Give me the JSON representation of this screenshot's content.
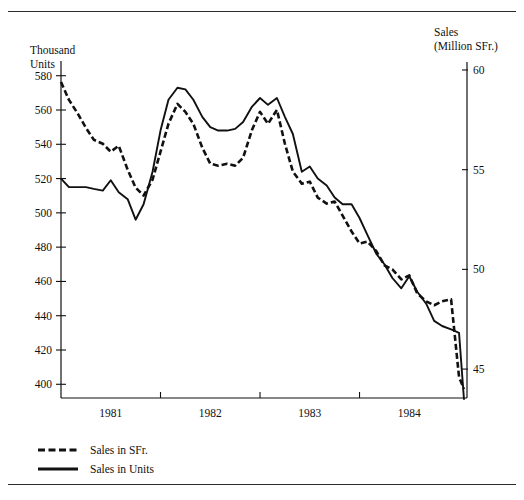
{
  "page": {
    "clipped_header_text": "",
    "background": "#ffffff",
    "ink": "#111111"
  },
  "chart_data": {
    "type": "line",
    "title": "",
    "subtitle": "",
    "xlabel": "",
    "ylabel": "Thousand\nUnits",
    "y2label": "Sales\n(Million SFr.)",
    "grid": false,
    "legend_position": "below-left",
    "x_axis": {
      "tick_labels": [
        "1981",
        "1982",
        "1983",
        "1984"
      ],
      "tick_positions": [
        0.5,
        1.5,
        2.5,
        3.5
      ],
      "boundary_ticks": [
        1,
        2,
        3
      ],
      "xlim": [
        0,
        4.08
      ]
    },
    "y_axis_left": {
      "label": "Thousand Units",
      "tick_labels": [
        "400",
        "420",
        "440",
        "460",
        "480",
        "500",
        "520",
        "540",
        "560",
        "580"
      ],
      "tick_values": [
        400,
        420,
        440,
        460,
        480,
        500,
        520,
        540,
        560,
        580
      ],
      "ylim": [
        392,
        588
      ]
    },
    "y_axis_right": {
      "label": "Sales (Million SFr.)",
      "tick_labels": [
        "45",
        "50",
        "55",
        "60"
      ],
      "tick_values": [
        45,
        50,
        55,
        60
      ],
      "ylim": [
        43.55,
        60.4
      ]
    },
    "series": [
      {
        "name": "Sales in SFr.",
        "axis": "right",
        "style": "dashed",
        "color": "#111111",
        "units": "Million SFr.",
        "x": [
          0.0,
          0.08,
          0.17,
          0.25,
          0.33,
          0.42,
          0.5,
          0.58,
          0.67,
          0.75,
          0.83,
          0.92,
          1.0,
          1.08,
          1.17,
          1.25,
          1.33,
          1.42,
          1.5,
          1.58,
          1.67,
          1.75,
          1.83,
          1.92,
          2.0,
          2.08,
          2.17,
          2.25,
          2.33,
          2.42,
          2.5,
          2.58,
          2.67,
          2.75,
          2.83,
          2.92,
          3.0,
          3.08,
          3.17,
          3.25,
          3.33,
          3.42,
          3.5,
          3.58,
          3.67,
          3.75,
          3.83,
          3.92,
          4.0,
          4.05
        ],
        "values": [
          59.4,
          58.5,
          57.8,
          57.1,
          56.5,
          56.3,
          55.9,
          56.2,
          55.0,
          54.1,
          53.7,
          54.5,
          55.9,
          57.3,
          58.3,
          57.9,
          57.3,
          56.1,
          55.3,
          55.2,
          55.3,
          55.2,
          55.6,
          57.0,
          57.9,
          57.3,
          58.0,
          56.3,
          54.9,
          54.3,
          54.4,
          53.6,
          53.3,
          53.4,
          52.7,
          51.9,
          51.3,
          51.4,
          50.9,
          50.2,
          50.0,
          49.5,
          49.7,
          48.8,
          48.4,
          48.2,
          48.4,
          48.5,
          44.6,
          44.0
        ]
      },
      {
        "name": "Sales in Units",
        "axis": "left",
        "style": "solid",
        "color": "#111111",
        "units": "Thousand Units",
        "x": [
          0.0,
          0.08,
          0.17,
          0.25,
          0.33,
          0.42,
          0.5,
          0.58,
          0.67,
          0.75,
          0.83,
          0.92,
          1.0,
          1.08,
          1.17,
          1.25,
          1.33,
          1.42,
          1.5,
          1.58,
          1.67,
          1.75,
          1.83,
          1.92,
          2.0,
          2.08,
          2.17,
          2.25,
          2.33,
          2.42,
          2.5,
          2.58,
          2.67,
          2.75,
          2.83,
          2.92,
          3.0,
          3.08,
          3.17,
          3.25,
          3.33,
          3.42,
          3.5,
          3.58,
          3.67,
          3.75,
          3.83,
          3.92,
          4.0,
          4.05
        ],
        "values": [
          520,
          515,
          515,
          515,
          514,
          513,
          519,
          512,
          508,
          496,
          505,
          524,
          548,
          566,
          573,
          572,
          566,
          556,
          550,
          548,
          548,
          549,
          553,
          562,
          567,
          563,
          567,
          556,
          546,
          524,
          527,
          520,
          516,
          509,
          505,
          505,
          497,
          487,
          476,
          470,
          462,
          456,
          463,
          454,
          447,
          437,
          434,
          432,
          430,
          391
        ]
      }
    ],
    "annotations": []
  },
  "legend": {
    "items": [
      {
        "label": "Sales in SFr.",
        "style": "dashed"
      },
      {
        "label": "Sales in Units",
        "style": "solid"
      }
    ]
  }
}
